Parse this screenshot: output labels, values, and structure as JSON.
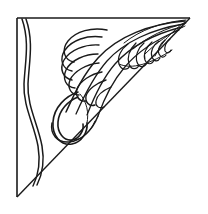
{
  "artwork": {
    "title": "Decorative Corner Ornament",
    "subject": "acanthus-plume-corner-flourish",
    "style": "line-art-engraving",
    "orientation": "top-left-corner",
    "background_color": "#ffffff",
    "ink_color": "#1a1a1a",
    "canvas": {
      "width": 208,
      "height": 214
    }
  },
  "geometry": {
    "frame": {
      "name": "right-triangle-border",
      "corner_top_left": [
        17,
        18
      ],
      "corner_top_right": [
        190,
        18
      ],
      "corner_bottom_left": [
        17,
        197
      ],
      "top_edge": "M17,18 L190,18",
      "left_edge": "M17,18 L17,197",
      "hypotenuse": "M190,18 L17,197"
    },
    "wave": {
      "name": "left-margin-s-curve",
      "outer": "M22,19 C30,42 25,62 24,84 C23,106 34,124 38,146 C41,164 38,176 33,186",
      "inner": "M26,19 C34,42 29,62 28,84 C27,106 38,124 42,146 C45,163 42,175 37,185"
    },
    "plume": {
      "name": "acanthus-plume",
      "spine_outer": "M185,21 C150,24 118,36 98,58 C82,76 74,95 66,112",
      "spine_mid": "M184,24 C152,29 124,42 107,61 C93,77 84,96 76,114",
      "spine_inner": "M182,27 C154,34 130,47 115,64 C102,79 94,97 87,115",
      "spine_core": "M179,30 C157,39 137,52 124,68 C112,82 104,99 98,116",
      "stem": "M98,116 C92,131 81,141 69,142 C57,143 50,134 52,123"
    },
    "fan": {
      "name": "main-lobe-fan",
      "count": 8,
      "center": [
        96,
        60
      ],
      "description": "broad overlapping lobes fanning to the left"
    },
    "inner_fan": {
      "name": "secondary-lobe-fan",
      "count": 7,
      "center": [
        150,
        42
      ],
      "description": "small overlapping lobes fanning down-right"
    },
    "hook": {
      "name": "scroll-hook-curl",
      "outer": "M78,92 C66,96 54,107 53,122 C52,136 61,146 72,144 C82,142 88,132 87,123",
      "inner": "M78,97 C68,101 59,110 58,122 C57,133 64,141 72,140 C79,139 84,131 83,124"
    }
  },
  "labels": {
    "frame": "triangular border",
    "wave": "S-scroll margin line",
    "plume": "acanthus plume",
    "fan": "lobe fan",
    "hook": "scroll hook"
  }
}
